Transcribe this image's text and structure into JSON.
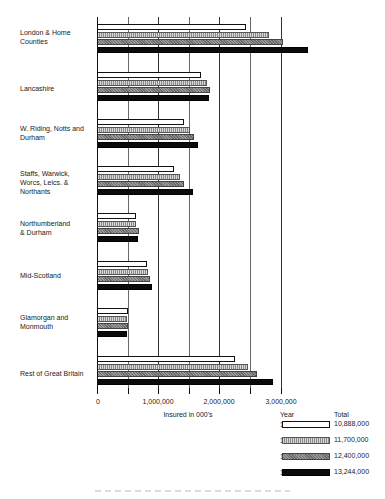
{
  "chart_data": {
    "type": "bar",
    "orientation": "horizontal",
    "title": "",
    "xlabel": "Insured in 000's",
    "ylabel": "",
    "xlim": [
      0,
      3500000
    ],
    "x_ticks": [
      "0",
      "1,000,000",
      "2,000,000",
      "3,000,000"
    ],
    "grid": true,
    "legend_position": "bottom-right",
    "categories": [
      "London & Home Counties",
      "Lancashire",
      "W. Riding, Notts and Durham",
      "Staffs, Warwick, Worcs, Leics. & Northants",
      "Northumberland & Durham",
      "Mid-Scotland",
      "Glamorgan and Monmouth",
      "Rest of Great Britain"
    ],
    "series": [
      {
        "name": "1923",
        "total": "10,888,000",
        "values": [
          2430000,
          1700000,
          1420000,
          1260000,
          640000,
          810000,
          500000,
          2260000
        ]
      },
      {
        "name": "1929",
        "total": "11,700,000",
        "values": [
          2810000,
          1800000,
          1520000,
          1350000,
          630000,
          830000,
          490000,
          2460000
        ]
      },
      {
        "name": "1932",
        "total": "12,400,000",
        "values": [
          3040000,
          1850000,
          1580000,
          1420000,
          690000,
          870000,
          500000,
          2610000
        ]
      },
      {
        "name": "1937",
        "total": "13,244,000",
        "values": [
          3450000,
          1830000,
          1650000,
          1570000,
          670000,
          900000,
          490000,
          2870000
        ]
      }
    ]
  },
  "labels": {
    "london_1": "London & Home",
    "london_2": "Counties",
    "lancashire": "Lancashire",
    "wriding_1": "W. Riding, Notts and",
    "wriding_2": "Durham",
    "staffs_1": "Staffs, Warwick,",
    "staffs_2": "Worcs, Leics. &",
    "staffs_3": "Northants",
    "northumb_1": "Northumberland",
    "northumb_2": "& Durham",
    "midscot": "Mid-Scotland",
    "glam_1": "Glamorgan and",
    "glam_2": "Monmouth",
    "rest": "Rest of Great Britain"
  },
  "axis": {
    "t0": "0",
    "t1": "1,000,000",
    "t2": "2,000,000",
    "t3": "3,000,000",
    "xlabel": "Insured in 000's"
  },
  "legend": {
    "year_header": "Year",
    "total_header": "Total",
    "rows": [
      {
        "year": "1923",
        "total": "10,888,000"
      },
      {
        "year": "1929",
        "total": "11,700,000"
      },
      {
        "year": "1932",
        "total": "12,400,000"
      },
      {
        "year": "1937",
        "total": "13,244,000"
      }
    ]
  }
}
